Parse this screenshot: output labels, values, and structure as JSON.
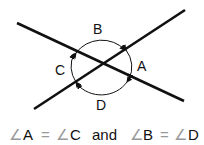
{
  "diagram": {
    "labels": {
      "A": "A",
      "B": "B",
      "C": "C",
      "D": "D"
    },
    "caption": {
      "angle_symbol": "∠",
      "left": {
        "a": "A",
        "eq": "=",
        "b": "C"
      },
      "conjunction": "and",
      "right": {
        "a": "B",
        "eq": "=",
        "b": "D"
      }
    },
    "colors": {
      "line": "#111111",
      "text": "#111111",
      "angle_symbol": "#999999"
    }
  }
}
